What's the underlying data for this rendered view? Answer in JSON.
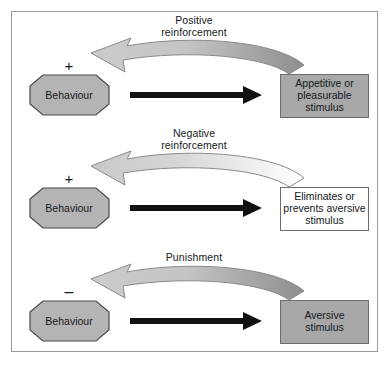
{
  "diagram": {
    "frame_border_color": "#9a9a9a",
    "background": "#ffffff",
    "behaviour_shape_fill": "#b4b4b4",
    "behaviour_shape_stroke": "#4a4a4a",
    "black_arrow_color": "#111111",
    "curved_arrow_stroke": "#8a8a8a"
  },
  "rows": [
    {
      "id": "positive-reinforcement",
      "curve_label": "Positive\nreinforcement",
      "sign": "+",
      "behaviour_label": "Behaviour",
      "stimulus_label": "Appetitive or\npleasurable\nstimulus",
      "stimulus_style": "shaded",
      "stimulus_fill": "#a8a8a8",
      "curve_fill_start": "#d7d7d7",
      "curve_fill_end": "#9a9a9a"
    },
    {
      "id": "negative-reinforcement",
      "curve_label": "Negative\nreinforcement",
      "sign": "+",
      "behaviour_label": "Behaviour",
      "stimulus_label": "Eliminates or\nprevents aversive\nstimulus",
      "stimulus_style": "plain",
      "stimulus_fill": "#ffffff",
      "curve_fill_start": "#d0d0d0",
      "curve_fill_end": "#ffffff"
    },
    {
      "id": "punishment",
      "curve_label": "Punishment",
      "sign": "–",
      "behaviour_label": "Behaviour",
      "stimulus_label": "Aversive\nstimulus",
      "stimulus_style": "shaded",
      "stimulus_fill": "#a8a8a8",
      "curve_fill_start": "#d7d7d7",
      "curve_fill_end": "#9a9a9a"
    }
  ]
}
